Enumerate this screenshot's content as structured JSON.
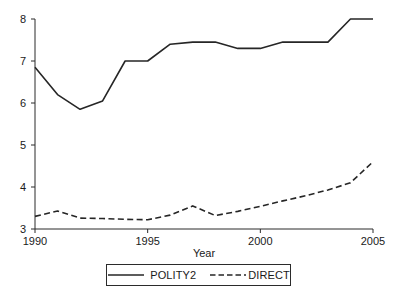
{
  "chart_data": {
    "type": "line",
    "title": "",
    "xlabel": "Year",
    "ylabel": "",
    "grid": false,
    "legend_position": "bottom",
    "x": [
      1990,
      1991,
      1992,
      1993,
      1994,
      1995,
      1996,
      1997,
      1998,
      1999,
      2000,
      2001,
      2002,
      2003,
      2004,
      2005
    ],
    "xlim": [
      1990,
      2005
    ],
    "ylim": [
      3,
      8
    ],
    "xticks": [
      1990,
      1995,
      2000,
      2005
    ],
    "xtick_labels": [
      "1990",
      "1995",
      "2000",
      "2005"
    ],
    "yticks": [
      3,
      4,
      5,
      6,
      7,
      8
    ],
    "ytick_labels": [
      "3",
      "4",
      "5",
      "6",
      "7",
      "8"
    ],
    "series": [
      {
        "name": "POLITY2",
        "style": "solid",
        "color": "#262626",
        "values": [
          6.85,
          6.2,
          5.85,
          6.05,
          7.0,
          7.0,
          7.4,
          7.45,
          7.45,
          7.3,
          7.3,
          7.45,
          7.45,
          7.45,
          8.0,
          8.0
        ]
      },
      {
        "name": "DIRECT",
        "style": "dashed",
        "color": "#262626",
        "values": [
          3.3,
          3.43,
          3.26,
          3.25,
          3.23,
          3.22,
          3.33,
          3.55,
          3.32,
          3.42,
          3.54,
          3.67,
          3.79,
          3.93,
          4.1,
          4.6
        ]
      }
    ]
  },
  "legend": {
    "items": [
      {
        "label": "POLITY2",
        "style": "solid"
      },
      {
        "label": "DIRECT",
        "style": "dashed"
      }
    ]
  },
  "axes": {
    "x_axis_title": "Year"
  }
}
